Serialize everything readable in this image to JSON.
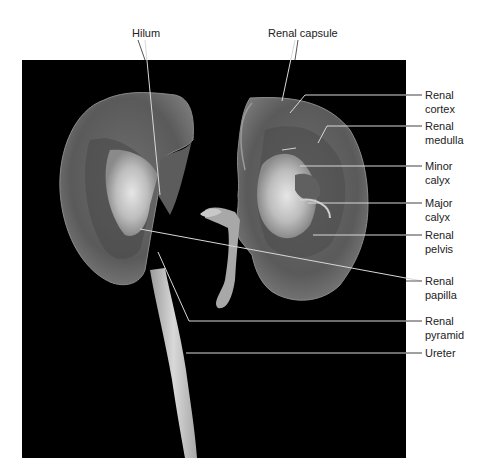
{
  "figure": {
    "background_color": "#000000",
    "label_color": "#222222",
    "leader_color": "#d8d8d8"
  },
  "labels": {
    "hilum": {
      "line1": "Hilum"
    },
    "renal_capsule": {
      "line1": "Renal capsule"
    },
    "renal_cortex": {
      "line1": "Renal",
      "line2": "cortex"
    },
    "renal_medulla": {
      "line1": "Renal",
      "line2": "medulla"
    },
    "minor_calyx": {
      "line1": "Minor",
      "line2": "calyx"
    },
    "major_calyx": {
      "line1": "Major",
      "line2": "calyx"
    },
    "renal_pelvis": {
      "line1": "Renal",
      "line2": "pelvis"
    },
    "renal_papilla": {
      "line1": "Renal",
      "line2": "papilla"
    },
    "renal_pyramid": {
      "line1": "Renal",
      "line2": "pyramid"
    },
    "ureter": {
      "line1": "Ureter"
    }
  }
}
